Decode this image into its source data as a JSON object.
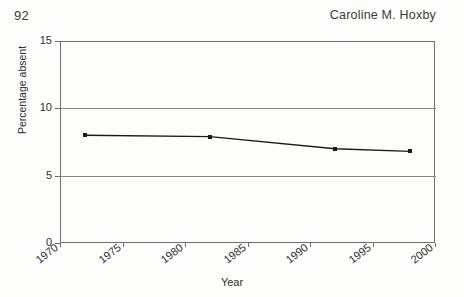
{
  "header": {
    "page_number": "92",
    "running_head": "Caroline M. Hoxby"
  },
  "chart_data": {
    "type": "line",
    "title": "",
    "xlabel": "Year",
    "ylabel": "Percentage absent",
    "xlim": [
      1970,
      2000
    ],
    "ylim": [
      0,
      15
    ],
    "xticks": [
      1970,
      1975,
      1980,
      1985,
      1990,
      1995,
      2000
    ],
    "xtick_labels": [
      "1970",
      "1975",
      "1980",
      "1985",
      "1990",
      "1995",
      "2000"
    ],
    "yticks": [
      0,
      5,
      10,
      15
    ],
    "ytick_labels": [
      "0",
      "5",
      "10",
      "15"
    ],
    "grid": "horizontal",
    "legend": "none",
    "marker": "square",
    "line_color": "#1a1a1a",
    "x": [
      1972,
      1982,
      1992,
      1998
    ],
    "values": [
      8.0,
      7.9,
      7.0,
      6.8
    ],
    "series": [
      {
        "name": "Percentage absent",
        "points": [
          {
            "x": 1972,
            "y": 8.0
          },
          {
            "x": 1982,
            "y": 7.9
          },
          {
            "x": 1992,
            "y": 7.0
          },
          {
            "x": 1998,
            "y": 6.8
          }
        ]
      }
    ]
  }
}
